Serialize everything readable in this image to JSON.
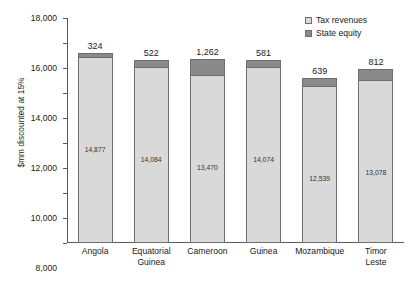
{
  "chart_data": {
    "type": "bar",
    "stacked": true,
    "title": "",
    "xlabel": "",
    "ylabel": "$mm discounted at 15%",
    "ylim": [
      0,
      18000
    ],
    "yticks": [
      0,
      2000,
      4000,
      6000,
      8000,
      10000,
      12000,
      14000,
      16000,
      18000
    ],
    "ytick_labels": [
      "0",
      "2,000",
      "4,000",
      "6,000",
      "8,000",
      "10,000",
      "12,000",
      "14,000",
      "16,000",
      "18,000"
    ],
    "grid": false,
    "legend_position": "top-right",
    "categories": [
      "Angola",
      "Equatorial Guinea",
      "Cameroon",
      "Guinea",
      "Mozambique",
      "Timor Leste"
    ],
    "category_lines": [
      [
        "Angola"
      ],
      [
        "Equatorial",
        "Guinea"
      ],
      [
        "Cameroon"
      ],
      [
        "Guinea"
      ],
      [
        "Mozambique"
      ],
      [
        "Timor",
        "Leste"
      ]
    ],
    "series": [
      {
        "name": "Tax revenues",
        "color": "#d9d9d9",
        "values": [
          14877,
          14084,
          13470,
          14074,
          12539,
          13078
        ],
        "labels": [
          "14,877",
          "14,084",
          "13,470",
          "14,074",
          "12,539",
          "13,078"
        ]
      },
      {
        "name": "State equity",
        "color": "#8a8a8a",
        "values": [
          324,
          522,
          1262,
          581,
          639,
          812
        ],
        "labels": [
          "324",
          "522",
          "1,262",
          "581",
          "639",
          "812"
        ]
      }
    ],
    "totals": [
      15201,
      14606,
      14732,
      14655,
      13178,
      13890
    ]
  },
  "legend": {
    "items": [
      {
        "label": "Tax revenues",
        "color": "#d9d9d9"
      },
      {
        "label": "State equity",
        "color": "#8a8a8a"
      }
    ]
  },
  "colors": {
    "tax_revenues": "#d9d9d9",
    "state_equity": "#8a8a8a",
    "axis": "#5a5a5a",
    "bar_border": "#6e6e6e",
    "background": "#ffffff"
  }
}
